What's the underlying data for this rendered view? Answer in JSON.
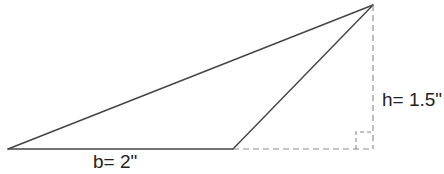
{
  "diagram": {
    "type": "triangle-area",
    "colors": {
      "line": "#444444",
      "dashed": "#8a8a8a",
      "text": "#222222",
      "background": "#ffffff"
    },
    "vertices": {
      "left": [
        8,
        149
      ],
      "base_right": [
        233,
        149
      ],
      "apex": [
        373,
        5
      ],
      "foot": [
        373,
        149
      ]
    },
    "labels": {
      "base": "b= 2\"",
      "height": "h= 1.5\""
    },
    "right_angle_marker_size": 17
  }
}
